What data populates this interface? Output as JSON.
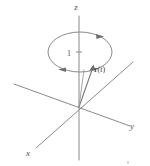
{
  "figure": {
    "background_color": "#ffffff",
    "line_color": "#8a8a8a",
    "text_color": "#555555",
    "axes": [
      {
        "key": "x",
        "label": "x",
        "label_x": 28,
        "label_y": 156
      },
      {
        "key": "y",
        "label": "y",
        "label_x": 132,
        "label_y": 129
      },
      {
        "key": "z",
        "label": "z",
        "label_x": 76,
        "label_y": 10
      }
    ],
    "ticks": [
      {
        "axis": "z",
        "label": "1",
        "label_x": 69,
        "label_y": 56,
        "tick_x": 79,
        "tick_y": 52
      }
    ],
    "vector": {
      "label_bold": "r",
      "label_open": "(",
      "label_var": "t",
      "label_close": ")",
      "label_x": 96,
      "label_y": 72,
      "origin_x": 79,
      "origin_y": 107,
      "tip_x": 93,
      "tip_y": 67
    },
    "orbit": {
      "center_x": 80,
      "center_y": 52,
      "radius_x": 32,
      "radius_y": 20,
      "direction": "counterclockwise-from-above",
      "arrow_top_right_x": 99,
      "arrow_top_right_y": 36,
      "arrow_bottom_left_x": 62,
      "arrow_bottom_left_y": 69
    }
  }
}
